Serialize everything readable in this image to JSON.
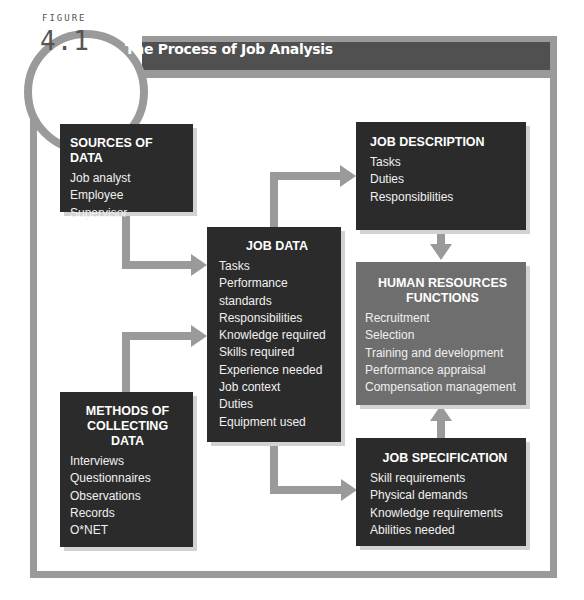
{
  "figure": {
    "label": "FIGURE",
    "number": "4.1",
    "title": "The Process of Job Analysis"
  },
  "colors": {
    "frame": "#9a9a9a",
    "title_bar": "#505050",
    "dark_box": "#2b2b2b",
    "hr_box": "#6e6e6e",
    "arrow": "#9a9a9a"
  },
  "boxes": {
    "sources": {
      "title": "SOURCES OF DATA",
      "items": [
        "Job analyst",
        "Employee",
        "Supervisor"
      ]
    },
    "methods": {
      "title_line1": "METHODS OF",
      "title_line2": "COLLECTING DATA",
      "items": [
        "Interviews",
        "Questionnaires",
        "Observations",
        "Records",
        "O*NET"
      ]
    },
    "job_data": {
      "title": "JOB DATA",
      "items": [
        "Tasks",
        "Performance",
        "standards",
        "Responsibilities",
        "Knowledge required",
        "Skills required",
        "Experience needed",
        "Job context",
        "Duties",
        "Equipment used"
      ]
    },
    "job_description": {
      "title": "JOB DESCRIPTION",
      "items": [
        "Tasks",
        "Duties",
        "Responsibilities"
      ]
    },
    "hr_functions": {
      "title_line1": "HUMAN RESOURCES",
      "title_line2": "FUNCTIONS",
      "items": [
        "Recruitment",
        "Selection",
        "Training and development",
        "Performance appraisal",
        "Compensation management"
      ]
    },
    "job_specification": {
      "title": "JOB SPECIFICATION",
      "items": [
        "Skill requirements",
        "Physical demands",
        "Knowledge requirements",
        "Abilities needed"
      ]
    }
  },
  "flows": [
    {
      "from": "SOURCES OF DATA",
      "to": "JOB DATA"
    },
    {
      "from": "METHODS OF COLLECTING DATA",
      "to": "JOB DATA"
    },
    {
      "from": "JOB DATA",
      "to": "JOB DESCRIPTION"
    },
    {
      "from": "JOB DATA",
      "to": "JOB SPECIFICATION"
    },
    {
      "from": "JOB DESCRIPTION",
      "to": "HUMAN RESOURCES FUNCTIONS"
    },
    {
      "from": "JOB SPECIFICATION",
      "to": "HUMAN RESOURCES FUNCTIONS"
    }
  ]
}
